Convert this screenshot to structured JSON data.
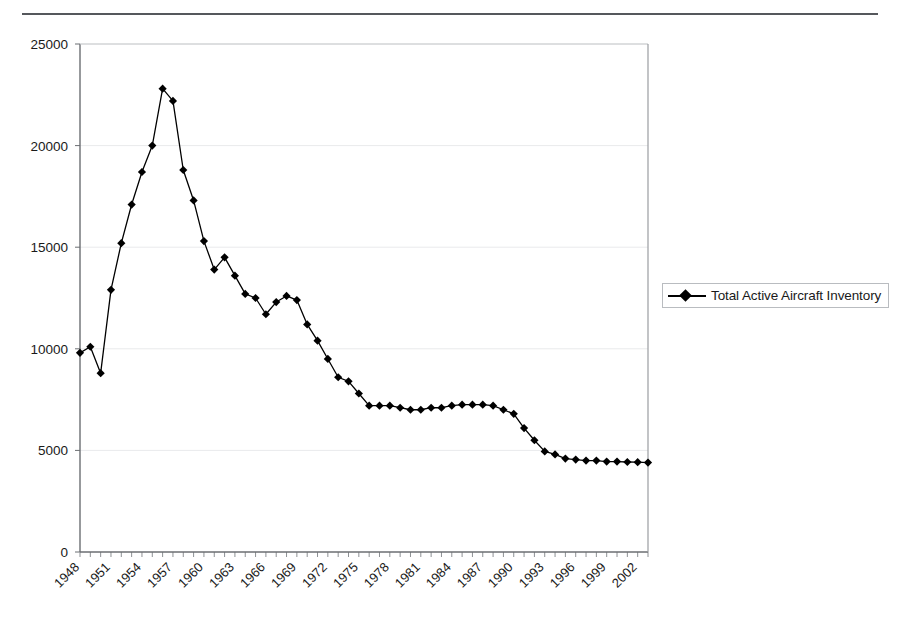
{
  "page": {
    "heading_fragment": "",
    "rule": "horizontal-rule"
  },
  "legend": {
    "position": "right",
    "entries": [
      {
        "label": "Total Active Aircraft Inventory",
        "color": "#000000",
        "marker": "diamond"
      }
    ]
  },
  "chart_data": {
    "type": "line",
    "title": "",
    "subtitle": "",
    "xlabel": "",
    "ylabel": "",
    "grid": true,
    "grid_axis": "y",
    "legend_position": "right",
    "marker": "diamond",
    "line_color": "#000000",
    "xlim": [
      1948,
      2003
    ],
    "ylim": [
      0,
      25000
    ],
    "yticks": [
      0,
      5000,
      10000,
      15000,
      20000,
      25000
    ],
    "ytick_labels": [
      "0",
      "5000",
      "10000",
      "15000",
      "20000",
      "25000"
    ],
    "xtick_labels": [
      "1948",
      "1951",
      "1954",
      "1957",
      "1960",
      "1963",
      "1966",
      "1969",
      "1972",
      "1975",
      "1978",
      "1981",
      "1984",
      "1987",
      "1990",
      "1993",
      "1996",
      "1999",
      "2002"
    ],
    "xtick_rotation": 45,
    "xtick_step": 3,
    "series": [
      {
        "name": "Total Active Aircraft Inventory",
        "x": [
          1948,
          1949,
          1950,
          1951,
          1952,
          1953,
          1954,
          1955,
          1956,
          1957,
          1958,
          1959,
          1960,
          1961,
          1962,
          1963,
          1964,
          1965,
          1966,
          1967,
          1968,
          1969,
          1970,
          1971,
          1972,
          1973,
          1974,
          1975,
          1976,
          1977,
          1978,
          1979,
          1980,
          1981,
          1982,
          1983,
          1984,
          1985,
          1986,
          1987,
          1988,
          1989,
          1990,
          1991,
          1992,
          1993,
          1994,
          1995,
          1996,
          1997,
          1998,
          1999,
          2000,
          2001,
          2002,
          2003
        ],
        "values": [
          9800,
          10100,
          8800,
          12900,
          15200,
          17100,
          18700,
          20000,
          22800,
          22200,
          18800,
          17300,
          15300,
          13900,
          14500,
          13600,
          12700,
          12500,
          11700,
          12300,
          12600,
          12400,
          11200,
          10400,
          9500,
          8600,
          8400,
          7800,
          7200,
          7200,
          7200,
          7100,
          7000,
          7000,
          7100,
          7100,
          7200,
          7250,
          7250,
          7250,
          7200,
          7000,
          6800,
          6100,
          5500,
          4950,
          4800,
          4600,
          4550,
          4500,
          4500,
          4450,
          4450,
          4430,
          4420,
          4400
        ]
      }
    ]
  }
}
